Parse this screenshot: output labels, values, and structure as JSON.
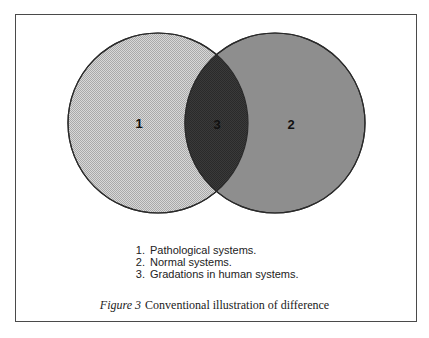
{
  "figure": {
    "caption_label": "Figure 3",
    "caption_text": "Conventional illustration of difference"
  },
  "venn": {
    "left_circle": {
      "label": "1",
      "cx": 158,
      "cy": 123,
      "r": 90,
      "fill": "#cfcfcf",
      "pattern": "fine-dither"
    },
    "right_circle": {
      "label": "2",
      "cx": 275,
      "cy": 123,
      "r": 90,
      "fill": "#8e8e8e"
    },
    "overlap": {
      "label": "3",
      "fill": "#3a3a3a"
    },
    "stroke": "#2a2a2a"
  },
  "legend": {
    "items": [
      {
        "num": "1.",
        "text": "Pathological systems."
      },
      {
        "num": "2.",
        "text": "Normal systems."
      },
      {
        "num": "3.",
        "text": "Gradations in human systems."
      }
    ]
  }
}
